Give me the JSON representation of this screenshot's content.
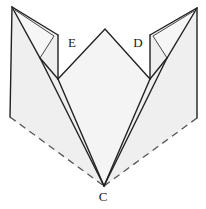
{
  "figure": {
    "kind": "origami-fold-diagram",
    "background_color": "#ffffff",
    "fill_center": "#f4f4f4",
    "fill_wing": "#efefef",
    "fill_spike": "#f2f2f2",
    "stroke_color": "#222222",
    "dash_color": "#555555",
    "stroke_width": "1.4",
    "thin_stroke_width": "0.9",
    "dash_pattern": "7,5",
    "width": 206,
    "height": 209
  },
  "labels": {
    "left_flap": "E",
    "right_flap": "D",
    "bottom_apex": "C"
  },
  "label_positions": {
    "left_flap": {
      "x": 72,
      "y": 44
    },
    "right_flap": {
      "x": 138,
      "y": 44
    },
    "bottom_apex": {
      "x": 103,
      "y": 198
    }
  },
  "geometry": {
    "center_panel": "105,29 150,79 104,186 58,79",
    "left_wing": "58,79 104,186 10,117",
    "right_wing": "150,79 104,186 197,118",
    "left_spike_outer": "12,7 58,35 38,60 10,117",
    "left_spike_inner": "15,10 54,36 40,58",
    "left_spike_flap": "12,7 52,39 58,35",
    "right_spike_outer": "197,8 150,35 169,60 197,118",
    "right_spike_inner": "194,11 153,36 167,58",
    "right_spike_flap": "197,8 156,39 150,35",
    "left_dashed_edge": "10,117 104,186",
    "right_dashed_edge": "197,118 104,186",
    "center_left_edge": "105,29 58,79",
    "center_right_edge": "105,29 150,79",
    "center_left_down": "58,79 104,186",
    "center_right_down": "150,79 104,186",
    "left_notch_edge": "58,79 58,35",
    "right_notch_edge": "150,79 150,35"
  }
}
